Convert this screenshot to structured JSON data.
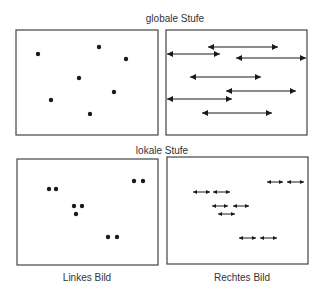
{
  "labels": {
    "global_stage": "globale Stufe",
    "local_stage": "lokale Stufe",
    "left_image": "Linkes Bild",
    "right_image": "Rechtes Bild"
  },
  "colors": {
    "ink": "#1a1a1a",
    "frame": "#444444"
  },
  "panels": {
    "global_left": {
      "box": [
        16,
        30,
        158,
        135
      ],
      "dots": [
        [
          38,
          54
        ],
        [
          99,
          47
        ],
        [
          126,
          59
        ],
        [
          79,
          78
        ],
        [
          114,
          92
        ],
        [
          51,
          100
        ],
        [
          90,
          114
        ]
      ]
    },
    "global_right": {
      "box": [
        166,
        30,
        307,
        135
      ],
      "arrows": [
        [
          208,
          278,
          47
        ],
        [
          167,
          220,
          54
        ],
        [
          236,
          306,
          58
        ],
        [
          190,
          261,
          77
        ],
        [
          226,
          296,
          91
        ],
        [
          167,
          232,
          99
        ],
        [
          202,
          272,
          113
        ]
      ]
    },
    "local_left": {
      "box": [
        17,
        159,
        158,
        265
      ],
      "dots": [
        [
          49,
          189
        ],
        [
          56,
          189
        ],
        [
          134,
          181
        ],
        [
          143,
          181
        ],
        [
          74,
          206
        ],
        [
          82,
          206
        ],
        [
          76,
          214
        ],
        [
          108,
          237
        ],
        [
          117,
          237
        ]
      ]
    },
    "local_right": {
      "box": [
        167,
        157,
        308,
        264
      ],
      "arrows": [
        [
          267,
          283,
          182
        ],
        [
          287,
          304,
          182
        ],
        [
          193,
          210,
          192
        ],
        [
          213,
          230,
          192
        ],
        [
          212,
          228,
          206
        ],
        [
          233,
          249,
          206
        ],
        [
          218,
          235,
          214
        ],
        [
          239,
          256,
          238
        ],
        [
          260,
          277,
          238
        ]
      ]
    }
  }
}
